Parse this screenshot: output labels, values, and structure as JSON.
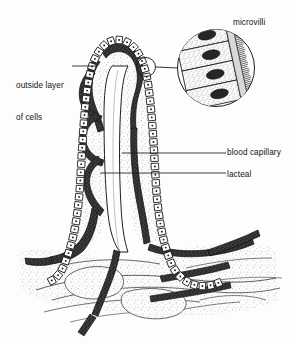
{
  "figure": {
    "background_color": "#fdfdfd",
    "ink_color": "#1a1a1a"
  },
  "labels": {
    "outside_layer": {
      "line1": "outside layer",
      "line2": "of cells"
    },
    "microvilli": "microvilli",
    "blood_capillary": "blood capillary",
    "lacteal": "lacteal"
  },
  "structures": [
    {
      "name": "villus",
      "description": "Tall finger-like projection lined with a single layer of epithelial cells"
    },
    {
      "name": "epithelial-cell-layer",
      "description": "Chain of rectangular cells, each with a central dot nucleus, outlining the villus"
    },
    {
      "name": "blood-capillary-network",
      "description": "Dark stippled looping vessels inside the villus core"
    },
    {
      "name": "lacteal",
      "description": "Central lymphatic vessel running up the middle of the villus"
    },
    {
      "name": "submucosa",
      "description": "Stippled connective tissue at the base with branching vessels"
    },
    {
      "name": "microvilli-inset",
      "description": "Magnified circular inset showing four epithelial cells with dark oval nuclei and brush-border microvilli"
    }
  ],
  "inset": {
    "cell_count": 4,
    "callout_circle_radius": 10,
    "inset_circle_radius": 39
  },
  "colors": {
    "ink": "#1a1a1a",
    "vessel_fill": "#3a3a3a",
    "tissue_stipple": "#9a9a9a",
    "paper": "#fdfdfd"
  }
}
